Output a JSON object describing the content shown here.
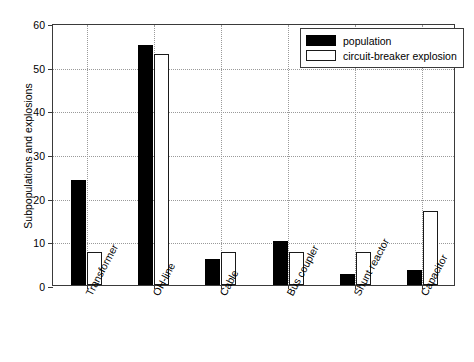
{
  "chart_data": {
    "type": "bar",
    "title": "",
    "subtitle": "",
    "xlabel": "",
    "ylabel": "Subpopulations and explosions",
    "categories": [
      "Transformer",
      "OH-line",
      "Cable",
      "Bus coupler",
      "Shunt reactor",
      "Capacitor"
    ],
    "series": [
      {
        "name": "population",
        "values": [
          24,
          55,
          6,
          10,
          2.5,
          3.5
        ],
        "color": "#000000",
        "fill": "solid"
      },
      {
        "name": "circuit-breaker explosion",
        "values": [
          7.5,
          53,
          7.5,
          7.5,
          7.5,
          17
        ],
        "color": "#ffffff",
        "fill": "outline"
      }
    ],
    "ylim": [
      0,
      60
    ],
    "yticks": [
      0,
      10,
      20,
      30,
      40,
      50,
      60
    ],
    "ytick_labels": [
      "0",
      "10",
      "20",
      "30",
      "40",
      "50",
      "60"
    ],
    "grid": "dotted-both",
    "legend_position": "top-right",
    "legend_entries": [
      "population",
      "circuit-breaker explosion"
    ],
    "annotations": []
  }
}
